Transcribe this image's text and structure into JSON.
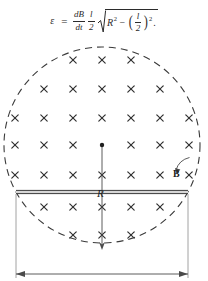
{
  "formula": {
    "lhs": "ε",
    "equals": "=",
    "frac1": {
      "num": "dB",
      "den": "dt"
    },
    "frac2": {
      "num": "l",
      "den": "2"
    },
    "radicand_first": "R",
    "radicand_first_exp": "2",
    "minus": "−",
    "paren_open": "(",
    "paren_close": ")",
    "inner_frac": {
      "num": "l",
      "den": "2"
    },
    "paren_exp": "2",
    "period": "."
  },
  "diagram": {
    "field_symbol": "×",
    "labels": {
      "radius": "R",
      "field": "B",
      "length": "l"
    },
    "circle": {
      "center_x": 102,
      "center_y": 111,
      "radius": 98,
      "style": "dashed",
      "color": "#3a3a3a"
    },
    "rod": {
      "x1": 16,
      "x2": 188,
      "y": 158,
      "color": "#4a4a4a"
    },
    "center_dot": {
      "x": 102,
      "y": 111
    },
    "radius_arrow": {
      "x": 102,
      "y1": 111,
      "y2": 214
    },
    "dimension_line": {
      "x1": 16,
      "x2": 188,
      "y": 240
    },
    "field_marks": [
      {
        "y": 26,
        "xs": [
          73,
          102,
          131
        ]
      },
      {
        "y": 55,
        "xs": [
          44,
          73,
          102,
          131,
          160
        ]
      },
      {
        "y": 84,
        "xs": [
          15,
          44,
          73,
          102,
          131,
          160,
          189
        ]
      },
      {
        "y": 111,
        "xs": [
          15,
          44,
          73,
          131,
          160,
          189
        ]
      },
      {
        "y": 141,
        "xs": [
          15,
          44,
          73,
          102,
          131,
          160,
          189
        ]
      },
      {
        "y": 173,
        "xs": [
          44,
          73,
          102,
          131,
          160
        ]
      },
      {
        "y": 201,
        "xs": [
          73,
          102,
          131
        ]
      }
    ],
    "b_arrow": {
      "from_x": 176,
      "from_y": 136,
      "to_x": 190,
      "to_y": 124
    }
  }
}
